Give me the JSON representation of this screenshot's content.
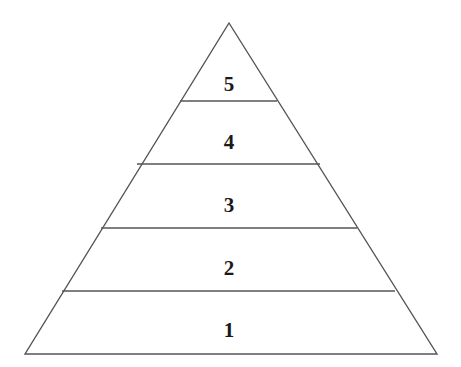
{
  "figure": {
    "name": "five-level-pyramid",
    "type": "pyramid-diagram",
    "background_color": "#ffffff",
    "stroke_color": "#555555",
    "text_color": "#1a1a1a",
    "stroke_width": 1.4
  },
  "geometry": {
    "apex": {
      "x": 229,
      "y": 23
    },
    "base_left": {
      "x": 25,
      "y": 354
    },
    "base_right": {
      "x": 437,
      "y": 354
    },
    "dividers": [
      {
        "id": "divider-5-4",
        "y": 101,
        "x1": 180,
        "x2": 277
      },
      {
        "id": "divider-4-3",
        "y": 164,
        "x1": 137,
        "x2": 320
      },
      {
        "id": "divider-3-2",
        "y": 228,
        "x1": 101,
        "x2": 357
      },
      {
        "id": "divider-2-1",
        "y": 291,
        "x1": 62,
        "x2": 395
      }
    ]
  },
  "levels": [
    {
      "id": "level-5",
      "label": "5",
      "cx": 229,
      "cy": 84
    },
    {
      "id": "level-4",
      "label": "4",
      "cx": 229,
      "cy": 142
    },
    {
      "id": "level-3",
      "label": "3",
      "cx": 229,
      "cy": 205
    },
    {
      "id": "level-2",
      "label": "2",
      "cx": 229,
      "cy": 268
    },
    {
      "id": "level-1",
      "label": "1",
      "cx": 229,
      "cy": 330
    }
  ],
  "chart_data": {
    "type": "pyramid",
    "title": "",
    "xlabel": "",
    "ylabel": "",
    "categories": [
      "1",
      "2",
      "3",
      "4",
      "5"
    ],
    "values": [
      1,
      2,
      3,
      4,
      5
    ],
    "labels_top_to_bottom": [
      "5",
      "4",
      "3",
      "2",
      "1"
    ],
    "level_count": 5,
    "orientation": "apex-up",
    "grid": false,
    "legend": "none",
    "annotations": []
  }
}
